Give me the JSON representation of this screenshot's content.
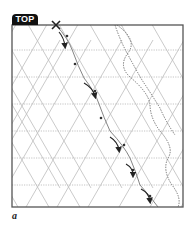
{
  "figure": {
    "tab_label": "TOP",
    "caption": "a",
    "start_mark": "x-mark",
    "colors": {
      "border": "#555555",
      "grid": "#b5b5b5",
      "arrow": "#222222",
      "tab_bg": "#111111",
      "tab_text": "#ffffff"
    },
    "grid": {
      "type": "triangular",
      "rows": 7,
      "horizontal_style": "dotted",
      "diagonal_style": "solid"
    },
    "fold_steps": [
      {
        "index": 1,
        "arrow": "curved-fold-arrow"
      },
      {
        "index": 2,
        "arrow": "curved-fold-arrow"
      },
      {
        "index": 3,
        "arrow": "curved-fold-arrow"
      },
      {
        "index": 4,
        "arrow": "curved-fold-arrow"
      },
      {
        "index": 5,
        "arrow": "curved-fold-arrow"
      }
    ],
    "guide_curves": 2
  }
}
